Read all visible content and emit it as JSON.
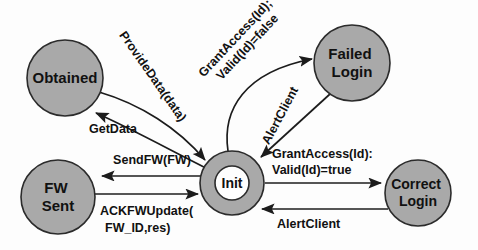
{
  "diagram": {
    "type": "state-machine",
    "title": "",
    "colors": {
      "node_fill": "#a9a9a9",
      "node_stroke": "#2b2b2b",
      "inner_fill": "#fefefe",
      "edge_stroke": "#1c1c1c",
      "text": "#111111",
      "background": "#fdfdfd"
    },
    "nodes": [
      {
        "id": "obtained",
        "label_lines": [
          "Obtained"
        ],
        "cx": 65,
        "cy": 78,
        "r": 38,
        "double": false
      },
      {
        "id": "failed_login",
        "label_lines": [
          "Failed",
          "Login"
        ],
        "cx": 352,
        "cy": 63,
        "r": 38,
        "double": false
      },
      {
        "id": "init",
        "label_lines": [
          "Init"
        ],
        "cx": 232,
        "cy": 183,
        "r": 32,
        "inner_r": 17,
        "double": true
      },
      {
        "id": "fw_sent",
        "label_lines": [
          "FW",
          "Sent"
        ],
        "cx": 58,
        "cy": 197,
        "r": 37,
        "double": false
      },
      {
        "id": "correct_login",
        "label_lines": [
          "Correct",
          "Login"
        ],
        "cx": 418,
        "cy": 193,
        "r": 33,
        "double": false
      }
    ],
    "edges": [
      {
        "id": "provide-data",
        "from": "obtained",
        "to": "init",
        "label_lines": [
          "ProvideData(data)"
        ],
        "label_rotation": 55
      },
      {
        "id": "get-data",
        "from": "init",
        "to": "obtained",
        "label_lines": [
          "GetData"
        ],
        "label_rotation": 0
      },
      {
        "id": "grant-access-false",
        "from": "init",
        "to": "failed_login",
        "label_lines": [
          "GrantAccess(Id);",
          "Valid(Id)=false"
        ],
        "label_rotation": -47
      },
      {
        "id": "alert-client-failed",
        "from": "failed_login",
        "to": "init",
        "label_lines": [
          "AlertClient"
        ],
        "label_rotation": -62
      },
      {
        "id": "send-fw",
        "from": "init",
        "to": "fw_sent",
        "label_lines": [
          "SendFW(FW)"
        ],
        "label_rotation": 0
      },
      {
        "id": "ack-fw-update",
        "from": "fw_sent",
        "to": "init",
        "label_lines": [
          "ACKFWUpdate(",
          "FW_ID,res)"
        ],
        "label_rotation": 0
      },
      {
        "id": "grant-access-true",
        "from": "init",
        "to": "correct_login",
        "label_lines": [
          "GrantAccess(Id):",
          "Valid(Id)=true"
        ],
        "label_rotation": 0
      },
      {
        "id": "alert-client-correct",
        "from": "correct_login",
        "to": "init",
        "label_lines": [
          "AlertClient"
        ],
        "label_rotation": 0
      }
    ]
  },
  "labels": {
    "obtained": "Obtained",
    "failed_login_1": "Failed",
    "failed_login_2": "Login",
    "init": "Init",
    "fw_sent_1": "FW",
    "fw_sent_2": "Sent",
    "correct_login_1": "Correct",
    "correct_login_2": "Login",
    "provide_data": "ProvideData(data)",
    "get_data": "GetData",
    "grant_access_false_1": "GrantAccess(Id);",
    "grant_access_false_2": "Valid(Id)=false",
    "alert_client_failed": "AlertClient",
    "send_fw": "SendFW(FW)",
    "ack_fw_update_1": "ACKFWUpdate(",
    "ack_fw_update_2": "FW_ID,res)",
    "grant_access_true_1": "GrantAccess(Id):",
    "grant_access_true_2": "Valid(Id)=true",
    "alert_client_correct": "AlertClient"
  }
}
